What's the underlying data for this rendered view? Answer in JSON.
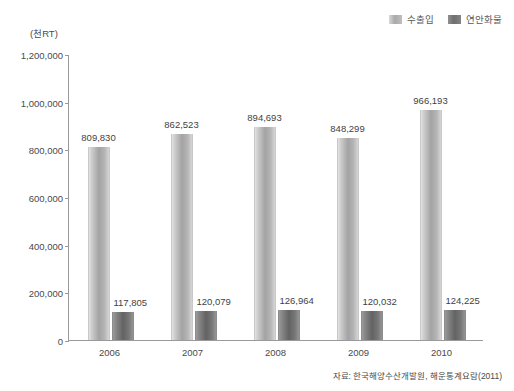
{
  "legend": {
    "position": "top-right",
    "items": [
      {
        "label": "수출입",
        "swatch": "light-gray-swatch",
        "color": "#a9a9a9"
      },
      {
        "label": "연안화물",
        "swatch": "dark-gray-swatch",
        "color": "#6e6e6e"
      }
    ]
  },
  "unit_label": "(천RT)",
  "source_note": "자료: 한국해양수산개발원, 해운통계요람(2011)",
  "axis": {
    "y_ticks": [
      "0",
      "200,000",
      "400,000",
      "600,000",
      "800,000",
      "1,000,000",
      "1,200,000"
    ],
    "x_ticks": [
      "2006",
      "2007",
      "2008",
      "2009",
      "2010"
    ]
  },
  "chart_data": {
    "type": "bar",
    "title": "",
    "subtitle": "",
    "xlabel": "",
    "ylabel": "(천RT)",
    "ylim": [
      0,
      1200000
    ],
    "ytick_values": [
      0,
      200000,
      400000,
      600000,
      800000,
      1000000,
      1200000
    ],
    "grid": false,
    "legend_position": "top-right",
    "categories": [
      "2006",
      "2007",
      "2008",
      "2009",
      "2010"
    ],
    "series": [
      {
        "name": "수출입",
        "color": "#a9a9a9",
        "values": [
          809830,
          862523,
          894693,
          848299,
          966193
        ],
        "labels": [
          "809,830",
          "862,523",
          "894,693",
          "848,299",
          "966,193"
        ]
      },
      {
        "name": "연안화물",
        "color": "#6e6e6e",
        "values": [
          117805,
          120079,
          126964,
          120032,
          124225
        ],
        "labels": [
          "117,805",
          "120,079",
          "126,964",
          "120,032",
          "124,225"
        ]
      }
    ]
  }
}
